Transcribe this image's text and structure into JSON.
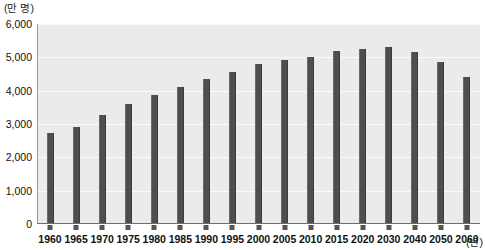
{
  "chart_data": {
    "type": "bar",
    "title": "",
    "subtitle": "",
    "xlabel": "(년)",
    "ylabel": "(만 명)",
    "unit_y_caption": "(만 명)",
    "unit_x_caption": "(년)",
    "categories": [
      "1960",
      "1965",
      "1970",
      "1975",
      "1980",
      "1985",
      "1990",
      "1995",
      "2000",
      "2005",
      "2010",
      "2015",
      "2020",
      "2030",
      "2040",
      "2050",
      "2060"
    ],
    "values": [
      2700,
      2900,
      3250,
      3600,
      3850,
      4100,
      4350,
      4550,
      4800,
      4900,
      5000,
      5200,
      5250,
      5300,
      5150,
      4850,
      4400
    ],
    "ylim": [
      0,
      6000
    ],
    "ytick_values": [
      0,
      1000,
      2000,
      3000,
      4000,
      5000,
      6000
    ],
    "ytick_labels": [
      "0",
      "1,000",
      "2,000",
      "3,000",
      "4,000",
      "5,000",
      "6,000"
    ],
    "grid": true,
    "grid_color": "#fbfbfb",
    "legend": null,
    "legend_position": "none",
    "bar_color": "#4e4e4e",
    "plot_background": "#ebebeb",
    "page_background": "#ffffff"
  }
}
